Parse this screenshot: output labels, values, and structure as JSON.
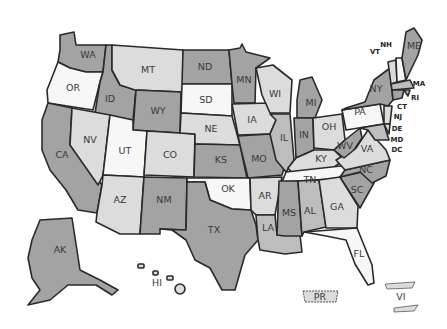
{
  "map": {
    "type": "us-states-choropleth",
    "shades": {
      "white": "#f7f7f7",
      "light": "#dcdcdc",
      "mid": "#bdbdbd",
      "dark": "#a3a3a3"
    },
    "states": [
      {
        "code": "WA",
        "shade": "dark"
      },
      {
        "code": "OR",
        "shade": "white"
      },
      {
        "code": "CA",
        "shade": "dark"
      },
      {
        "code": "ID",
        "shade": "dark"
      },
      {
        "code": "NV",
        "shade": "light"
      },
      {
        "code": "MT",
        "shade": "light"
      },
      {
        "code": "WY",
        "shade": "dark"
      },
      {
        "code": "UT",
        "shade": "white"
      },
      {
        "code": "AZ",
        "shade": "light"
      },
      {
        "code": "CO",
        "shade": "light"
      },
      {
        "code": "NM",
        "shade": "dark"
      },
      {
        "code": "ND",
        "shade": "dark"
      },
      {
        "code": "SD",
        "shade": "white"
      },
      {
        "code": "NE",
        "shade": "light"
      },
      {
        "code": "KS",
        "shade": "dark"
      },
      {
        "code": "OK",
        "shade": "white"
      },
      {
        "code": "TX",
        "shade": "dark"
      },
      {
        "code": "MN",
        "shade": "dark"
      },
      {
        "code": "IA",
        "shade": "light"
      },
      {
        "code": "MO",
        "shade": "dark"
      },
      {
        "code": "AR",
        "shade": "light"
      },
      {
        "code": "LA",
        "shade": "mid"
      },
      {
        "code": "WI",
        "shade": "light"
      },
      {
        "code": "IL",
        "shade": "mid"
      },
      {
        "code": "MI",
        "shade": "dark"
      },
      {
        "code": "IN",
        "shade": "dark"
      },
      {
        "code": "OH",
        "shade": "light"
      },
      {
        "code": "KY",
        "shade": "light"
      },
      {
        "code": "TN",
        "shade": "white"
      },
      {
        "code": "MS",
        "shade": "dark"
      },
      {
        "code": "AL",
        "shade": "mid"
      },
      {
        "code": "GA",
        "shade": "light"
      },
      {
        "code": "FL",
        "shade": "white"
      },
      {
        "code": "SC",
        "shade": "dark"
      },
      {
        "code": "NC",
        "shade": "dark"
      },
      {
        "code": "VA",
        "shade": "light"
      },
      {
        "code": "WV",
        "shade": "dark"
      },
      {
        "code": "PA",
        "shade": "white"
      },
      {
        "code": "NY",
        "shade": "dark"
      },
      {
        "code": "VT",
        "shade": "light"
      },
      {
        "code": "NH",
        "shade": "white"
      },
      {
        "code": "ME",
        "shade": "dark"
      },
      {
        "code": "MA",
        "shade": "mid"
      },
      {
        "code": "RI",
        "shade": "mid"
      },
      {
        "code": "CT",
        "shade": "dark"
      },
      {
        "code": "NJ",
        "shade": "light"
      },
      {
        "code": "DE",
        "shade": "light"
      },
      {
        "code": "MD",
        "shade": "mid"
      },
      {
        "code": "DC",
        "shade": "mid"
      },
      {
        "code": "AK",
        "shade": "dark"
      },
      {
        "code": "HI",
        "shade": "light"
      },
      {
        "code": "PR",
        "shade": "light"
      },
      {
        "code": "VI",
        "shade": "light"
      }
    ],
    "labels": {
      "WA": "WA",
      "OR": "OR",
      "CA": "CA",
      "ID": "ID",
      "NV": "NV",
      "MT": "MT",
      "WY": "WY",
      "UT": "UT",
      "AZ": "AZ",
      "CO": "CO",
      "NM": "NM",
      "ND": "ND",
      "SD": "SD",
      "NE": "NE",
      "KS": "KS",
      "OK": "OK",
      "TX": "TX",
      "MN": "MN",
      "IA": "IA",
      "MO": "MO",
      "AR": "AR",
      "LA": "LA",
      "WI": "WI",
      "IL": "IL",
      "MI": "MI",
      "IN": "IN",
      "OH": "OH",
      "KY": "KY",
      "TN": "TN",
      "MS": "MS",
      "AL": "AL",
      "GA": "GA",
      "FL": "FL",
      "SC": "SC",
      "NC": "NC",
      "VA": "VA",
      "WV": "WV",
      "PA": "PA",
      "NY": "NY",
      "VT": "VT",
      "NH": "NH",
      "ME": "ME",
      "MA": "MA",
      "RI": "RI",
      "CT": "CT",
      "NJ": "NJ",
      "DE": "DE",
      "MD": "MD",
      "DC": "DC",
      "AK": "AK",
      "HI": "HI",
      "PR": "PR",
      "VI": "VI"
    }
  }
}
